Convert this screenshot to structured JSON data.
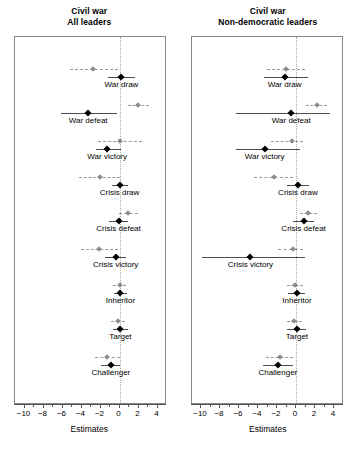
{
  "figure": {
    "panels": [
      {
        "title_line1": "Civil war",
        "title_line2": "All leaders",
        "xlabel": "Estimates"
      },
      {
        "title_line1": "Civil war",
        "title_line2": "Non-democratic leaders",
        "xlabel": "Estimates"
      }
    ],
    "tick_labels": [
      "−10",
      "−8",
      "−6",
      "−4",
      "−2",
      "0",
      "2",
      "4"
    ]
  },
  "colors": {
    "point_primary": "#000000",
    "point_secondary": "#8c8c8c",
    "interval_primary": "#4d4d4d",
    "interval_secondary": "#9a9a9a",
    "zero_line": "#aaaaaa",
    "frame": "#888888"
  },
  "chart_data": [
    {
      "type": "scatter",
      "title": "Civil war — All leaders",
      "xlabel": "Estimates",
      "ylabel": "",
      "xlim": [
        -11,
        5
      ],
      "xticks": [
        -10,
        -8,
        -6,
        -4,
        -2,
        0,
        2,
        4
      ],
      "grid": false,
      "zero_reference_line": 0,
      "categories": [
        "War draw",
        "War defeat",
        "War victory",
        "Crisis draw",
        "Crisis defeat",
        "Crisis victory",
        "Inheritor",
        "Target",
        "Challenger"
      ],
      "series": [
        {
          "name": "secondary estimate",
          "style": "dashed-gray",
          "points": [
            {
              "category": "War draw",
              "estimate": -2.8,
              "low": -5.2,
              "high": -0.2
            },
            {
              "category": "War defeat",
              "estimate": 1.9,
              "low": 0.9,
              "high": 3.1
            },
            {
              "category": "War victory",
              "estimate": 0.1,
              "low": -2.3,
              "high": 2.4
            },
            {
              "category": "Crisis draw",
              "estimate": -2.1,
              "low": -4.3,
              "high": 0.1
            },
            {
              "category": "Crisis defeat",
              "estimate": 0.9,
              "low": -0.1,
              "high": 2.0
            },
            {
              "category": "Crisis victory",
              "estimate": -2.2,
              "low": -4.1,
              "high": -0.2
            },
            {
              "category": "Inheritor",
              "estimate": 0.0,
              "low": -0.7,
              "high": 0.7
            },
            {
              "category": "Target",
              "estimate": -0.2,
              "low": -0.9,
              "high": 0.6
            },
            {
              "category": "Challenger",
              "estimate": -1.3,
              "low": -2.6,
              "high": 0.1
            }
          ]
        },
        {
          "name": "primary estimate",
          "style": "solid-black",
          "points": [
            {
              "category": "War draw",
              "estimate": 0.2,
              "low": -1.2,
              "high": 1.6
            },
            {
              "category": "War defeat",
              "estimate": -3.3,
              "low": -6.2,
              "high": -0.3
            },
            {
              "category": "War victory",
              "estimate": -1.3,
              "low": -2.5,
              "high": 0.2
            },
            {
              "category": "Crisis draw",
              "estimate": 0.0,
              "low": -0.8,
              "high": 0.9
            },
            {
              "category": "Crisis defeat",
              "estimate": -0.1,
              "low": -1.1,
              "high": 0.9
            },
            {
              "category": "Crisis victory",
              "estimate": -0.4,
              "low": -1.5,
              "high": 0.7
            },
            {
              "category": "Inheritor",
              "estimate": 0.1,
              "low": -0.6,
              "high": 0.8
            },
            {
              "category": "Target",
              "estimate": 0.1,
              "low": -0.7,
              "high": 0.9
            },
            {
              "category": "Challenger",
              "estimate": -0.9,
              "low": -1.9,
              "high": 0.1
            }
          ]
        }
      ]
    },
    {
      "type": "scatter",
      "title": "Civil war — Non-democratic leaders",
      "xlabel": "Estimates",
      "ylabel": "",
      "xlim": [
        -11,
        5
      ],
      "xticks": [
        -10,
        -8,
        -6,
        -4,
        -2,
        0,
        2,
        4
      ],
      "grid": false,
      "zero_reference_line": 0,
      "categories": [
        "War draw",
        "War defeat",
        "War victory",
        "Crisis draw",
        "Crisis defeat",
        "Crisis victory",
        "Inheritor",
        "Target",
        "Challenger"
      ],
      "series": [
        {
          "name": "secondary estimate",
          "style": "dashed-gray",
          "points": [
            {
              "category": "War draw",
              "estimate": -1.1,
              "low": -3.1,
              "high": 0.9
            },
            {
              "category": "War defeat",
              "estimate": 2.2,
              "low": 1.1,
              "high": 3.3
            },
            {
              "category": "War victory",
              "estimate": -0.4,
              "low": -2.6,
              "high": 0.7
            },
            {
              "category": "Crisis draw",
              "estimate": -2.3,
              "low": -4.4,
              "high": -0.3
            },
            {
              "category": "Crisis defeat",
              "estimate": 1.3,
              "low": 0.4,
              "high": 2.2
            },
            {
              "category": "Crisis victory",
              "estimate": -0.3,
              "low": -1.9,
              "high": 0.7
            },
            {
              "category": "Inheritor",
              "estimate": -0.1,
              "low": -0.9,
              "high": 0.7
            },
            {
              "category": "Target",
              "estimate": -0.2,
              "low": -1.0,
              "high": 0.6
            },
            {
              "category": "Challenger",
              "estimate": -1.7,
              "low": -3.2,
              "high": -0.3
            }
          ]
        },
        {
          "name": "primary estimate",
          "style": "solid-black",
          "points": [
            {
              "category": "War draw",
              "estimate": -1.2,
              "low": -3.4,
              "high": 1.3
            },
            {
              "category": "War defeat",
              "estimate": -0.5,
              "low": -6.3,
              "high": 3.6
            },
            {
              "category": "War victory",
              "estimate": -3.3,
              "low": -6.3,
              "high": 0.4
            },
            {
              "category": "Crisis draw",
              "estimate": 0.2,
              "low": -1.0,
              "high": 1.4
            },
            {
              "category": "Crisis defeat",
              "estimate": 0.8,
              "low": -0.3,
              "high": 1.9
            },
            {
              "category": "Crisis victory",
              "estimate": -4.8,
              "low": -9.9,
              "high": 0.9
            },
            {
              "category": "Inheritor",
              "estimate": 0.1,
              "low": -0.8,
              "high": 1.0
            },
            {
              "category": "Target",
              "estimate": 0.1,
              "low": -0.9,
              "high": 1.1
            },
            {
              "category": "Challenger",
              "estimate": -1.9,
              "low": -3.5,
              "high": -0.3
            }
          ]
        }
      ]
    }
  ]
}
